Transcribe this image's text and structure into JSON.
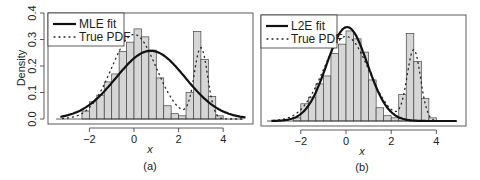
{
  "chart_data": [
    {
      "panel": "a",
      "type": "bar",
      "title": "",
      "caption": "(a)",
      "xlabel": "x",
      "ylabel": "Density",
      "xlim": [
        -3.5,
        5
      ],
      "ylim": [
        0,
        0.4
      ],
      "xticks": [
        -2,
        0,
        2,
        4
      ],
      "yticks": [
        0.0,
        0.1,
        0.2,
        0.3,
        0.4
      ],
      "ytick_labels": [
        "0.0",
        "0.1",
        "0.2",
        "0.3",
        "0.4"
      ],
      "legend": [
        {
          "label": "MLE fit",
          "style": "solid"
        },
        {
          "label": "True PDF",
          "style": "dotted"
        }
      ],
      "histogram": {
        "bin_width": 0.333,
        "bin_starts": [
          -2.333,
          -2.0,
          -1.667,
          -1.333,
          -1.0,
          -0.667,
          -0.333,
          0.0,
          0.333,
          0.667,
          1.0,
          1.333,
          1.667,
          2.0,
          2.333,
          2.667,
          3.0,
          3.333,
          3.667
        ],
        "values": [
          0.03,
          0.065,
          0.09,
          0.14,
          0.17,
          0.255,
          0.29,
          0.34,
          0.31,
          0.26,
          0.155,
          0.05,
          0.02,
          0.012,
          0.1,
          0.33,
          0.225,
          0.085,
          0.012
        ]
      },
      "series": [
        {
          "name": "MLE fit",
          "type": "line",
          "mean": 0.75,
          "sd": 1.55
        },
        {
          "name": "True PDF",
          "type": "dotted",
          "mixture": [
            {
              "w": 0.8,
              "mean": 0,
              "sd": 1
            },
            {
              "w": 0.2,
              "mean": 3,
              "sd": 0.3
            }
          ]
        }
      ]
    },
    {
      "panel": "b",
      "type": "bar",
      "title": "",
      "caption": "(b)",
      "xlabel": "x",
      "ylabel": "",
      "xlim": [
        -3.5,
        5
      ],
      "ylim": [
        0,
        0.4
      ],
      "xticks": [
        -2,
        0,
        2,
        4
      ],
      "legend": [
        {
          "label": "L2E fit",
          "style": "solid"
        },
        {
          "label": "True PDF",
          "style": "dotted"
        }
      ],
      "histogram": {
        "bin_width": 0.333,
        "bin_starts": [
          -2.333,
          -2.0,
          -1.667,
          -1.333,
          -1.0,
          -0.667,
          -0.333,
          0.0,
          0.333,
          0.667,
          1.0,
          1.333,
          1.667,
          2.0,
          2.333,
          2.667,
          3.0,
          3.333,
          3.667
        ],
        "values": [
          0.012,
          0.065,
          0.09,
          0.14,
          0.17,
          0.255,
          0.29,
          0.34,
          0.31,
          0.26,
          0.155,
          0.05,
          0.02,
          0.012,
          0.1,
          0.33,
          0.225,
          0.085,
          0.012
        ]
      },
      "series": [
        {
          "name": "L2E fit",
          "type": "line",
          "mean": 0.05,
          "sd": 0.9,
          "weight": 0.8
        },
        {
          "name": "True PDF",
          "type": "dotted",
          "mixture": [
            {
              "w": 0.8,
              "mean": 0,
              "sd": 1
            },
            {
              "w": 0.2,
              "mean": 3,
              "sd": 0.3
            }
          ]
        }
      ]
    }
  ],
  "panels": {
    "a": {
      "legend_1": "MLE fit",
      "legend_2": "True PDF",
      "xlabel": "x",
      "ylabel": "Density",
      "caption": "(a)"
    },
    "b": {
      "legend_1": "L2E fit",
      "legend_2": "True PDF",
      "xlabel": "x",
      "caption": "(b)"
    }
  }
}
